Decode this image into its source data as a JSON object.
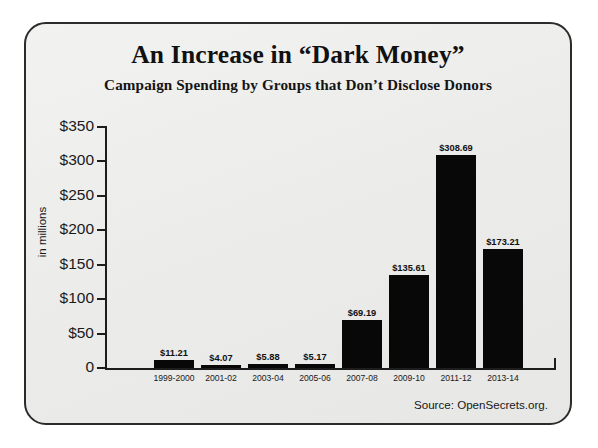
{
  "poster": {
    "title": "An Increase in “Dark Money”",
    "subtitle": "Campaign Spending by Groups that Don’t Disclose Donors",
    "source": "Source: OpenSecrets.org.",
    "background_color": "#ededec",
    "border_color": "#2b2b2b",
    "bar_color": "#080808"
  },
  "chart_data": {
    "type": "bar",
    "title": "An Increase in “Dark Money”",
    "subtitle": "Campaign Spending by Groups that Don’t Disclose Donors",
    "xlabel": "",
    "ylabel": "in millions",
    "ylim": [
      0,
      350
    ],
    "yticks": [
      0,
      50,
      100,
      150,
      200,
      250,
      300,
      350
    ],
    "ytick_labels": [
      "0",
      "$50",
      "$100",
      "$150",
      "$200",
      "$250",
      "$300",
      "$350"
    ],
    "grid": false,
    "legend": false,
    "value_label_format": "$0.00",
    "categories": [
      "1999-2000",
      "2001-02",
      "2003-04",
      "2005-06",
      "2007-08",
      "2009-10",
      "2011-12",
      "2013-14"
    ],
    "values": [
      11.21,
      4.07,
      5.88,
      5.17,
      69.19,
      135.61,
      308.69,
      173.21
    ],
    "value_labels": [
      "$11.21",
      "$4.07",
      "$5.88",
      "$5.17",
      "$69.19",
      "$135.61",
      "$308.69",
      "$173.21"
    ],
    "source": "Source: OpenSecrets.org."
  }
}
